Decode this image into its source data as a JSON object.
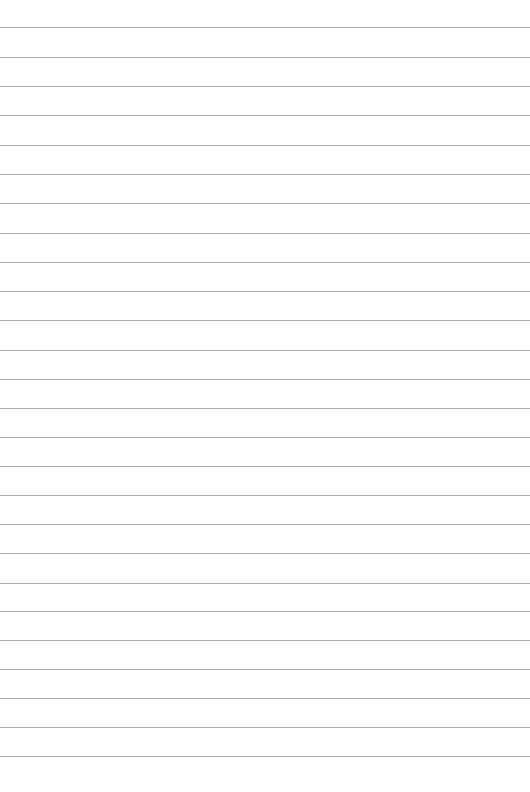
{
  "page": {
    "type": "lined-paper",
    "background_color": "#fefefe",
    "line_color": "#9a9a9a",
    "line_count": 26,
    "line_positions_y": [
      27,
      57,
      86,
      115,
      145,
      174,
      203,
      233,
      262,
      291,
      320,
      350,
      379,
      408,
      437,
      466,
      495,
      524,
      553,
      583,
      611,
      640,
      669,
      698,
      727,
      756
    ]
  }
}
